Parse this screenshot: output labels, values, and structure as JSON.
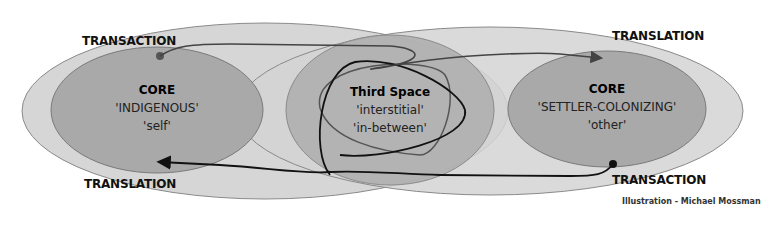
{
  "diagram": {
    "left_core": {
      "title": "CORE",
      "line1": "'INDIGENOUS'",
      "line2": "'self'"
    },
    "third_space": {
      "title": "Third Space",
      "line1": "'interstitial'",
      "line2": "'in-between'"
    },
    "right_core": {
      "title": "CORE",
      "line1": "'SETTLER-COLONIZING'",
      "line2": "'other'"
    },
    "labels": {
      "top_left": "TRANSACTION",
      "top_right": "TRANSLATION",
      "bottom_left": "TRANSLATION",
      "bottom_right": "TRANSACTION"
    },
    "credit": "Illustration - Michael Mossman",
    "colors": {
      "outer_ellipse": "#d4d4d4",
      "outer_stroke": "#8a8a8a",
      "core_fill": "#a8a8a8",
      "third_space_fill": "#ababab",
      "arrow_top": "#444444",
      "arrow_bottom": "#111111"
    }
  }
}
